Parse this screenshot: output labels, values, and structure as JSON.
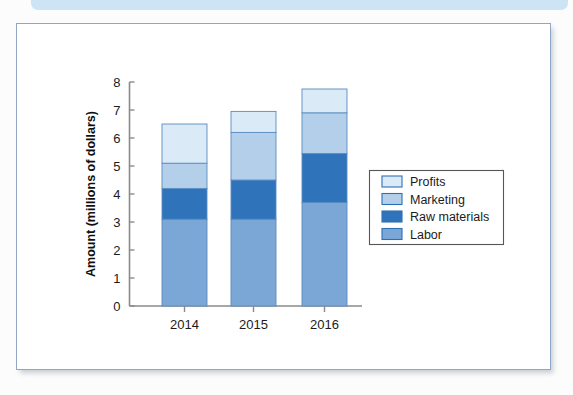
{
  "page": {
    "banner_color": "#cde4f4",
    "panel_border_color": "#8fa6c4",
    "panel_background": "#ffffff"
  },
  "chart_data": {
    "type": "bar",
    "subtype": "stacked-bar",
    "title": "",
    "xlabel": "",
    "ylabel": "Amount (millions of dollars)",
    "categories": [
      "2014",
      "2015",
      "2016"
    ],
    "ylim": [
      0,
      8
    ],
    "yticks": [
      0,
      1,
      2,
      3,
      4,
      5,
      6,
      7,
      8
    ],
    "ytick_labels": [
      "0",
      "1",
      "2",
      "3",
      "4",
      "5",
      "6",
      "7",
      "8"
    ],
    "grid": false,
    "legend_position": "right",
    "stack_order_bottom_to_top": [
      "Labor",
      "Raw materials",
      "Marketing",
      "Profits"
    ],
    "series": [
      {
        "name": "Profits",
        "color": "#daeaf7",
        "values": [
          1.4,
          0.75,
          0.85
        ]
      },
      {
        "name": "Marketing",
        "color": "#b4cfea",
        "values": [
          0.9,
          1.7,
          1.45
        ]
      },
      {
        "name": "Raw materials",
        "color": "#2f74ba",
        "values": [
          1.1,
          1.4,
          1.75
        ]
      },
      {
        "name": "Labor",
        "color": "#7ba7d7",
        "values": [
          3.1,
          3.1,
          3.7
        ]
      }
    ],
    "cumulative_tops": {
      "2014": {
        "Labor": 3.1,
        "Raw materials": 4.2,
        "Marketing": 5.1,
        "Profits": 6.5
      },
      "2015": {
        "Labor": 3.1,
        "Raw materials": 4.5,
        "Marketing": 6.2,
        "Profits": 6.95
      },
      "2016": {
        "Labor": 3.7,
        "Raw materials": 5.45,
        "Marketing": 6.9,
        "Profits": 7.75
      }
    },
    "totals": [
      6.5,
      6.95,
      7.75
    ],
    "axis_color": "#808080",
    "bar_outline_color": "#5a8cc2"
  },
  "legend": {
    "border_color": "#55565a",
    "items": [
      {
        "label": "Profits",
        "color": "#daeaf7",
        "swatch_border": "#2f6fb5"
      },
      {
        "label": "Marketing",
        "color": "#b4cfea",
        "swatch_border": "#2f6fb5"
      },
      {
        "label": "Raw materials",
        "color": "#2f74ba",
        "swatch_border": "#2f6fb5"
      },
      {
        "label": "Labor",
        "color": "#7ba7d7",
        "swatch_border": "#2f6fb5"
      }
    ]
  }
}
